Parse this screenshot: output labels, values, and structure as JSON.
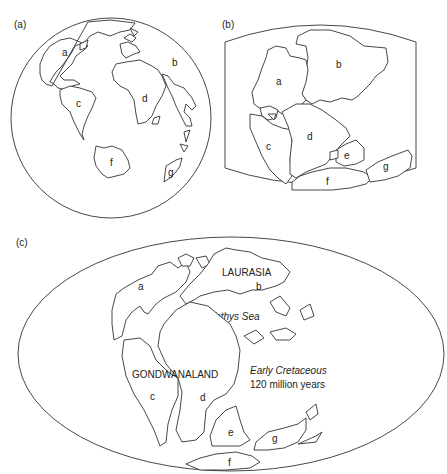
{
  "panels": {
    "a": {
      "label": "(a)",
      "description": "Present-day globe",
      "continents": [
        "a",
        "b",
        "c",
        "d",
        "f",
        "g"
      ]
    },
    "b": {
      "label": "(b)",
      "description": "Pangaea reconstruction",
      "continents": [
        "a",
        "b",
        "c",
        "d",
        "e",
        "f",
        "g"
      ]
    },
    "c": {
      "label": "(c)",
      "description": "Early Cretaceous world map",
      "continents": [
        "a",
        "b",
        "c",
        "d",
        "e",
        "f",
        "g"
      ],
      "supercontinents": [
        "LAURASIA",
        "GONDWANALAND"
      ],
      "sea": "Tethys Sea",
      "period": "Early Cretaceous",
      "age": "120 million years"
    }
  },
  "colors": {
    "line": "#333333",
    "background": "#ffffff"
  }
}
